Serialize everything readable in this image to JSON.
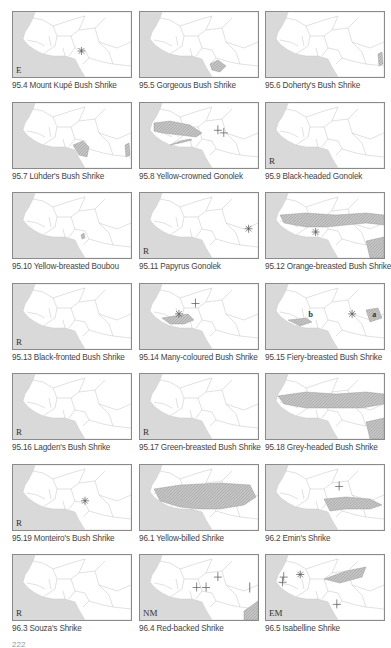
{
  "page_number": "222",
  "colors": {
    "sea": "#d9d9d9",
    "land": "#ffffff",
    "border": "#bdbdbd",
    "range": "#b5b5b5",
    "frame": "#8a8a8a",
    "marker": "#555555"
  },
  "maps": [
    {
      "id": "95.4",
      "label": "95.4 Mount Kupé Bush Shrike",
      "status": "E",
      "ranges": [],
      "markers": [
        {
          "type": "asterisk",
          "x": 0.58,
          "y": 0.6
        }
      ],
      "letters": []
    },
    {
      "id": "95.5",
      "label": "95.5 Gorgeous Bush Shrike",
      "status": "",
      "ranges": [
        "cameroon-coast-small"
      ],
      "markers": [],
      "letters": []
    },
    {
      "id": "95.6",
      "label": "95.6 Doherty's Bush Shrike",
      "status": "",
      "ranges": [
        "east-edge-small"
      ],
      "markers": [],
      "letters": []
    },
    {
      "id": "95.7",
      "label": "95.7 Lühder's Bush Shrike",
      "status": "",
      "ranges": [
        "nigeria-cameroon-patch",
        "east-edge-small"
      ],
      "markers": [],
      "letters": []
    },
    {
      "id": "95.8",
      "label": "95.8 Yellow-crowned Gonolek",
      "status": "",
      "ranges": [
        "west-sahel-band",
        "coast-line"
      ],
      "markers": [
        {
          "type": "cross",
          "x": 0.66,
          "y": 0.42
        },
        {
          "type": "cross",
          "x": 0.71,
          "y": 0.46
        }
      ],
      "letters": []
    },
    {
      "id": "95.9",
      "label": "95.9 Black-headed Gonolek",
      "status": "R",
      "ranges": [],
      "markers": [],
      "letters": []
    },
    {
      "id": "95.10",
      "label": "95.10 Yellow-breasted Boubou",
      "status": "",
      "ranges": [
        "nigeria-small-dot"
      ],
      "markers": [],
      "letters": []
    },
    {
      "id": "95.11",
      "label": "95.11 Papyrus Gonolek",
      "status": "R",
      "ranges": [],
      "markers": [
        {
          "type": "asterisk",
          "x": 0.92,
          "y": 0.55
        }
      ],
      "letters": []
    },
    {
      "id": "95.12",
      "label": "95.12 Orange-breasted Bush Shrike",
      "status": "",
      "ranges": [
        "wide-sahel-band",
        "southeast-block"
      ],
      "markers": [
        {
          "type": "asterisk",
          "x": 0.42,
          "y": 0.6
        }
      ],
      "letters": []
    },
    {
      "id": "95.13",
      "label": "95.13 Black-fronted Bush Shrike",
      "status": "R",
      "ranges": [],
      "markers": [],
      "letters": []
    },
    {
      "id": "95.14",
      "label": "95.14 Many-coloured Bush Shrike",
      "status": "",
      "ranges": [
        "guinea-coast-forest"
      ],
      "markers": [
        {
          "type": "asterisk",
          "x": 0.33,
          "y": 0.46
        },
        {
          "type": "cross",
          "x": 0.47,
          "y": 0.3
        }
      ],
      "letters": []
    },
    {
      "id": "95.15",
      "label": "95.15 Fiery-breasted Bush Shrike",
      "status": "",
      "ranges": [
        "guinea-coast-forest-b",
        "cameroon-patch-a"
      ],
      "markers": [
        {
          "type": "asterisk",
          "x": 0.73,
          "y": 0.46
        }
      ],
      "letters": [
        {
          "text": "b",
          "x": 0.36,
          "y": 0.46
        },
        {
          "text": "a",
          "x": 0.9,
          "y": 0.46
        }
      ]
    },
    {
      "id": "95.16",
      "label": "95.16 Lagden's Bush Shrike",
      "status": "R",
      "ranges": [],
      "markers": [],
      "letters": []
    },
    {
      "id": "95.17",
      "label": "95.17 Green-breasted Bush Shrike",
      "status": "R",
      "ranges": [],
      "markers": [],
      "letters": []
    },
    {
      "id": "95.18",
      "label": "95.18 Grey-headed Bush Shrike",
      "status": "",
      "ranges": [
        "wide-sahel-band-full",
        "southeast-block"
      ],
      "markers": [],
      "letters": []
    },
    {
      "id": "95.19",
      "label": "95.19 Monteiro's Bush Shrike",
      "status": "R",
      "ranges": [],
      "markers": [
        {
          "type": "asterisk",
          "x": 0.61,
          "y": 0.55
        }
      ],
      "letters": []
    },
    {
      "id": "96.1",
      "label": "96.1 Yellow-billed Shrike",
      "status": "",
      "ranges": [
        "wide-sahel-band-yb"
      ],
      "markers": [],
      "letters": []
    },
    {
      "id": "96.2",
      "label": "96.2 Emin's Shrike",
      "status": "",
      "ranges": [
        "emin-band"
      ],
      "markers": [
        {
          "type": "cross",
          "x": 0.62,
          "y": 0.33
        }
      ],
      "letters": []
    },
    {
      "id": "96.3",
      "label": "96.3 Souza's Shrike",
      "status": "R",
      "ranges": [],
      "markers": [],
      "letters": []
    },
    {
      "id": "96.4",
      "label": "96.4 Red-backed Shrike",
      "status": "NM",
      "ranges": [
        "southeast-corner"
      ],
      "markers": [
        {
          "type": "cross",
          "x": 0.48,
          "y": 0.5
        },
        {
          "type": "cross",
          "x": 0.56,
          "y": 0.5
        },
        {
          "type": "cross",
          "x": 0.66,
          "y": 0.34
        },
        {
          "type": "bar",
          "x": 0.93,
          "y": 0.5
        }
      ],
      "letters": []
    },
    {
      "id": "96.5",
      "label": "96.5 Isabelline Shrike",
      "status": "EM",
      "ranges": [
        "chad-wedge"
      ],
      "markers": [
        {
          "type": "cross",
          "x": 0.15,
          "y": 0.34
        },
        {
          "type": "cross",
          "x": 0.14,
          "y": 0.42
        },
        {
          "type": "asterisk",
          "x": 0.29,
          "y": 0.3
        },
        {
          "type": "cross",
          "x": 0.6,
          "y": 0.76
        }
      ],
      "letters": []
    }
  ]
}
